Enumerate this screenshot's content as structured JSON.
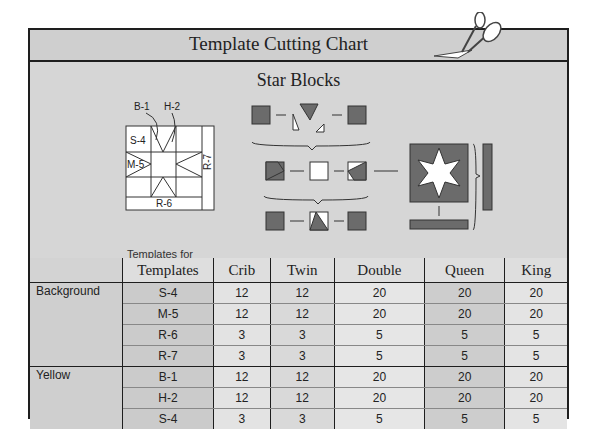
{
  "header": {
    "title": "Template Cutting Chart",
    "icon": "scissors-icon"
  },
  "section": {
    "title": "Star Blocks",
    "template_labels": [
      "B-1",
      "H-2",
      "S-4",
      "M-5",
      "R-7",
      "R-6"
    ],
    "caption_line1": "Templates for",
    "caption_line2": "Star Block"
  },
  "table": {
    "columns": [
      "",
      "Templates",
      "Crib",
      "Twin",
      "Double",
      "Queen",
      "King"
    ],
    "groups": [
      {
        "name": "Background",
        "rows": [
          {
            "template": "S-4",
            "crib": "12",
            "twin": "12",
            "double": "20",
            "queen": "20",
            "king": "20"
          },
          {
            "template": "M-5",
            "crib": "12",
            "twin": "12",
            "double": "20",
            "queen": "20",
            "king": "20"
          },
          {
            "template": "R-6",
            "crib": "3",
            "twin": "3",
            "double": "5",
            "queen": "5",
            "king": "5"
          },
          {
            "template": "R-7",
            "crib": "3",
            "twin": "3",
            "double": "5",
            "queen": "5",
            "king": "5"
          }
        ]
      },
      {
        "name": "Yellow",
        "rows": [
          {
            "template": "B-1",
            "crib": "12",
            "twin": "12",
            "double": "20",
            "queen": "20",
            "king": "20"
          },
          {
            "template": "H-2",
            "crib": "12",
            "twin": "12",
            "double": "20",
            "queen": "20",
            "king": "20"
          },
          {
            "template": "S-4",
            "crib": "3",
            "twin": "3",
            "double": "5",
            "queen": "5",
            "king": "5"
          }
        ]
      }
    ]
  },
  "colors": {
    "dark_fabric": "#6b6b6b",
    "light_fabric": "#ffffff",
    "band": "#d3d3d3",
    "border": "#1e1e1e"
  }
}
